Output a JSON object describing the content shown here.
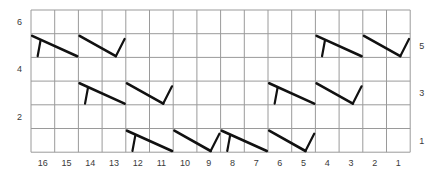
{
  "chart_data": {
    "type": "table",
    "title": "",
    "subtitle": "",
    "xlabel": "",
    "ylabel": "",
    "grid": true,
    "legend_position": "none",
    "columns": 16,
    "rows": 6,
    "column_labels": [
      "16",
      "15",
      "14",
      "13",
      "12",
      "11",
      "10",
      "9",
      "8",
      "7",
      "6",
      "5",
      "4",
      "3",
      "2",
      "1"
    ],
    "row_labels_left": [
      "6",
      "4",
      "2"
    ],
    "row_labels_right": [
      "5",
      "3",
      "1"
    ],
    "row_label_left_rows": [
      6,
      4,
      2
    ],
    "row_label_right_rows": [
      5,
      3,
      1
    ],
    "symbol_names": {
      "right-cross": "right-leaning-cable-cross",
      "left-cross": "left-leaning-cable-cross"
    },
    "symbols": [
      {
        "row": 5,
        "col_start": 16,
        "col_end": 15,
        "type": "right-cross"
      },
      {
        "row": 5,
        "col_start": 14,
        "col_end": 13,
        "type": "left-cross"
      },
      {
        "row": 5,
        "col_start": 4,
        "col_end": 3,
        "type": "right-cross"
      },
      {
        "row": 5,
        "col_start": 2,
        "col_end": 1,
        "type": "left-cross"
      },
      {
        "row": 3,
        "col_start": 14,
        "col_end": 13,
        "type": "right-cross"
      },
      {
        "row": 3,
        "col_start": 12,
        "col_end": 11,
        "type": "left-cross"
      },
      {
        "row": 3,
        "col_start": 6,
        "col_end": 5,
        "type": "right-cross"
      },
      {
        "row": 3,
        "col_start": 4,
        "col_end": 3,
        "type": "left-cross"
      },
      {
        "row": 1,
        "col_start": 12,
        "col_end": 11,
        "type": "right-cross"
      },
      {
        "row": 1,
        "col_start": 10,
        "col_end": 9,
        "type": "left-cross"
      },
      {
        "row": 1,
        "col_start": 8,
        "col_end": 7,
        "type": "right-cross"
      },
      {
        "row": 1,
        "col_start": 6,
        "col_end": 5,
        "type": "left-cross"
      }
    ],
    "colors": {
      "grid_line": "#9a9a9a",
      "symbol_stroke": "#111111",
      "label_text": "#3a3a3a",
      "background": "#ffffff"
    },
    "geometry": {
      "grid_left": 31,
      "grid_top": 10,
      "cell_w": 23.7,
      "cell_h": 23.7,
      "stroke_thick": 2.6,
      "stroke_thin": 2.2,
      "grid_stroke": 1
    }
  }
}
